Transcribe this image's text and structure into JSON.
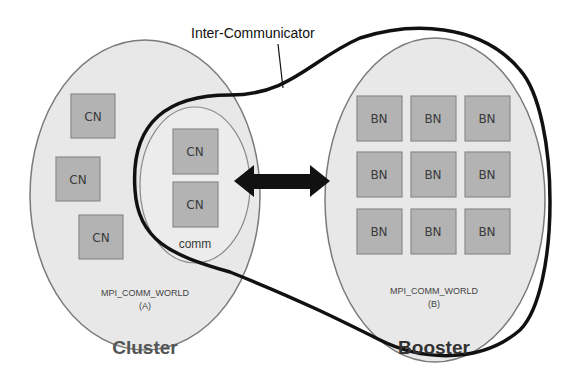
{
  "diagram": {
    "intercommunicator_label": "Inter-Communicator",
    "cluster": {
      "title": "Cluster",
      "world_label": "MPI_COMM_WORLD",
      "world_sub": "(A)",
      "nodes": [
        "CN",
        "CN",
        "CN"
      ],
      "comm": {
        "label": "comm",
        "nodes": [
          "CN",
          "CN"
        ]
      }
    },
    "booster": {
      "title": "Booster",
      "world_label": "MPI_COMM_WORLD",
      "world_sub": "(B)",
      "nodes": [
        "BN",
        "BN",
        "BN",
        "BN",
        "BN",
        "BN",
        "BN",
        "BN",
        "BN"
      ]
    },
    "colors": {
      "ellipse_fill": "#e8e8e8",
      "ellipse_stroke": "#7a7a7a",
      "node_fill": "#b3b3b3",
      "node_stroke": "#8a8a8a",
      "title_color": "#555555",
      "booster_title_color": "#333333",
      "arrow_color": "#111111"
    }
  }
}
